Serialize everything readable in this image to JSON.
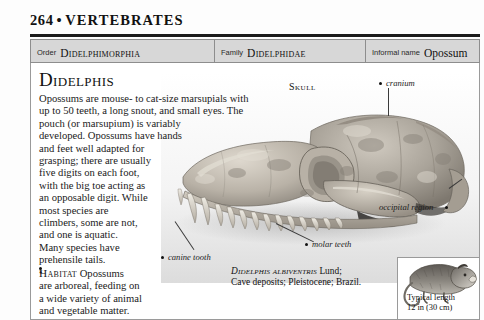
{
  "page": {
    "folio": "264",
    "separator": "•",
    "running_head": "VERTEBRATES"
  },
  "taxonomy_banner": {
    "order": {
      "label": "Order",
      "value": "Didelphimorphia"
    },
    "family": {
      "label": "Family",
      "value": "Didelphidae"
    },
    "informal": {
      "label": "Informal name",
      "value": "Opossum"
    }
  },
  "entry": {
    "genus": "Didelphis",
    "paragraph_lines": [
      "Opossums are mouse- to cat-size marsupials with",
      "up to 50 teeth, a long snout, and small eyes. The",
      "pouch (or marsupium) is variably",
      "developed. Opossums have hands",
      "and feet well adapted for",
      "grasping; there are usually",
      "five digits on each foot,",
      "with the big toe acting as",
      "an opposable digit. While",
      "most species are",
      "climbers, some are not,",
      "and one is aquatic.",
      "Many species have",
      "prehensile tails."
    ],
    "habitat": {
      "bullet": "•",
      "keyword": "Habitat",
      "lines": [
        "Opossums",
        "are arboreal, feeding on",
        "a wide variety of animal",
        "and vegetable matter."
      ]
    }
  },
  "figure": {
    "caption": "Skull",
    "labels": [
      {
        "name": "cranium",
        "text": "cranium"
      },
      {
        "name": "occipital-region",
        "text": "occipital region"
      },
      {
        "name": "molar-teeth",
        "text": "molar teeth"
      },
      {
        "name": "canine-tooth",
        "text": "canine tooth"
      }
    ],
    "specimen_caption": {
      "scientific_name": "Didelphis albiventris",
      "rest_line1": " Lund;",
      "line2": "Cave deposits; Pleistocene; Brazil."
    }
  },
  "scale": {
    "line1": "Typical length",
    "line2": "12 in (30 cm)"
  },
  "colors": {
    "rule": "#1b1b1b",
    "banner_fill": "#d7d7d7",
    "banner_stroke": "#8d8d8d",
    "frame_stroke": "#9a9a9a",
    "text": "#1a1a1a",
    "page_bg": "#fdfdfd"
  }
}
